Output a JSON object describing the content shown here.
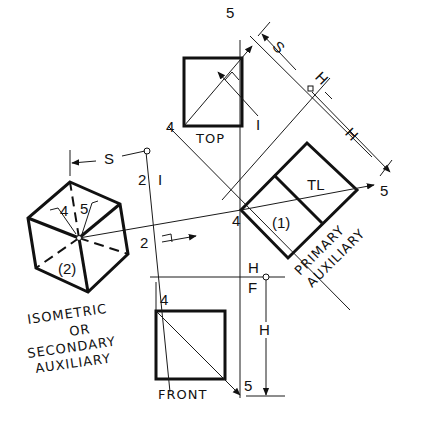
{
  "figure": {
    "views": {
      "top": {
        "label": "TOP"
      },
      "front": {
        "label": "FRONT"
      },
      "primary_auxiliary": {
        "line1": "PRIMARY",
        "line2": "AUXILIARY",
        "region_label": "(1)",
        "true_length_label": "TL"
      },
      "secondary_auxiliary": {
        "line1": "ISOMETRIC",
        "line2": "OR",
        "line3": "SECONDARY",
        "line4": "AUXILIARY",
        "region_label": "(2)"
      }
    },
    "points": {
      "top_4": "4",
      "top_5": "5",
      "aux_4": "4",
      "aux_5": "5",
      "front_4": "4",
      "front_5": "5",
      "iso_4": "4",
      "iso_5": "5"
    },
    "dimensions": {
      "s_top": "S",
      "h_aux": "H",
      "h_front": "H",
      "s_iso": "S"
    },
    "fold_lines": {
      "h_upper": "H",
      "one_upper": "I",
      "h_lower": "H",
      "f_lower": "F",
      "two_left": "2",
      "one_right": "I",
      "view_arrow_1": "I",
      "view_arrow_2": "2"
    }
  }
}
